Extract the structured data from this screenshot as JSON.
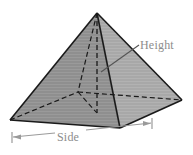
{
  "figure": {
    "shape_name": "square-pyramid",
    "background_color": "#ffffff",
    "labels": {
      "height": "Height",
      "side": "Side"
    },
    "label_color": "#8c8c8c",
    "geometry": {
      "apex": [
        97,
        13
      ],
      "base_front": [
        120,
        128
      ],
      "base_left": [
        10,
        120
      ],
      "base_right": [
        182,
        100
      ],
      "base_back_hidden": [
        78,
        92
      ],
      "height_foot": [
        97,
        113
      ]
    },
    "faces": [
      {
        "name": "left-face",
        "fill": "#8f8f8f",
        "points": "97,13 10,120 120,128"
      },
      {
        "name": "right-face",
        "fill": "#a8a8a8",
        "points": "97,13 120,128 182,100"
      }
    ],
    "edges": {
      "solid_color": "#1a1a1a",
      "hidden_color": "#1a1a1a",
      "hidden_dash": "4,3"
    },
    "leader_line": {
      "name": "height-leader",
      "from": [
        101,
        72
      ],
      "to": [
        139,
        45
      ],
      "color": "#555555"
    },
    "dimension_line": {
      "name": "side-dimension",
      "from": [
        12,
        138
      ],
      "to": [
        152,
        122
      ],
      "color": "#9a9a9a",
      "tick_style": "arrow-both-ends"
    }
  }
}
